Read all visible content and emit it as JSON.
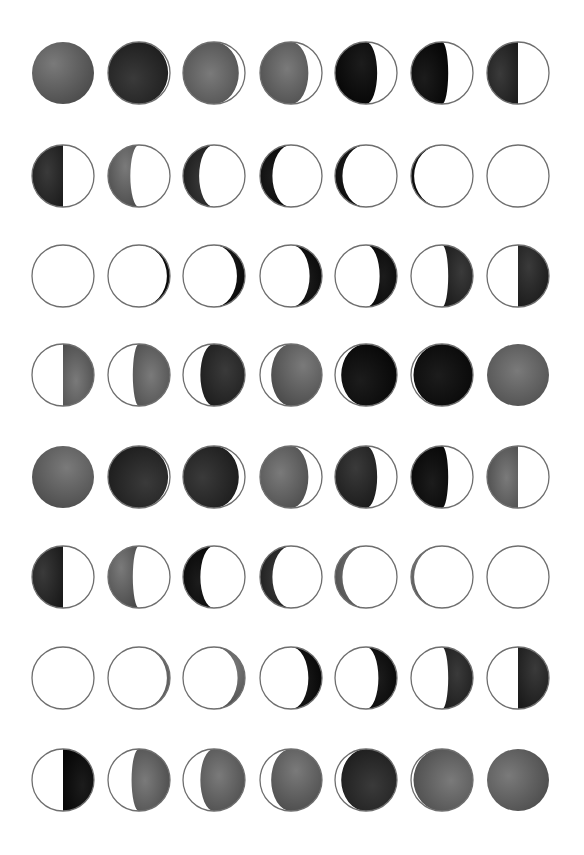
{
  "sheet": {
    "background": "#ffffff",
    "outline_color": "#6e6e6e",
    "lit_color": "#ffffff",
    "columns": 7,
    "rows": 8,
    "col_centers": [
      63,
      139,
      214,
      291,
      366,
      442,
      518
    ],
    "row_centers": [
      73,
      176,
      276,
      375,
      477,
      577,
      678,
      780
    ],
    "radius": 31
  },
  "palette": {
    "gray": [
      "#7a7a7a",
      "#4a4a4a"
    ],
    "dark": [
      "#3a3a3a",
      "#1a1a1a"
    ],
    "black": [
      "#1c1c1c",
      "#050505"
    ]
  },
  "rows": [
    {
      "label": "waning-1",
      "moons": [
        {
          "side": "full",
          "dark": 1.0,
          "tone": "gray"
        },
        {
          "side": "left",
          "dark": 0.97,
          "tone": "dark"
        },
        {
          "side": "left",
          "dark": 0.9,
          "tone": "gray"
        },
        {
          "side": "left",
          "dark": 0.78,
          "tone": "gray"
        },
        {
          "side": "left",
          "dark": 0.68,
          "tone": "black"
        },
        {
          "side": "left",
          "dark": 0.6,
          "tone": "black"
        },
        {
          "side": "left",
          "dark": 0.5,
          "tone": "dark"
        }
      ]
    },
    {
      "label": "waning-2",
      "moons": [
        {
          "side": "left",
          "dark": 0.5,
          "tone": "dark"
        },
        {
          "side": "left",
          "dark": 0.36,
          "tone": "gray"
        },
        {
          "side": "left",
          "dark": 0.26,
          "tone": "dark"
        },
        {
          "side": "left",
          "dark": 0.2,
          "tone": "black"
        },
        {
          "side": "left",
          "dark": 0.12,
          "tone": "black"
        },
        {
          "side": "left",
          "dark": 0.05,
          "tone": "black"
        },
        {
          "side": "none",
          "dark": 0.0,
          "tone": "black"
        }
      ]
    },
    {
      "label": "waxing-1",
      "moons": [
        {
          "side": "none",
          "dark": 0.0,
          "tone": "black"
        },
        {
          "side": "right",
          "dark": 0.05,
          "tone": "black"
        },
        {
          "side": "right",
          "dark": 0.13,
          "tone": "black"
        },
        {
          "side": "right",
          "dark": 0.2,
          "tone": "black"
        },
        {
          "side": "right",
          "dark": 0.28,
          "tone": "black"
        },
        {
          "side": "right",
          "dark": 0.4,
          "tone": "dark"
        },
        {
          "side": "right",
          "dark": 0.5,
          "tone": "dark"
        }
      ]
    },
    {
      "label": "waxing-2",
      "moons": [
        {
          "side": "right",
          "dark": 0.5,
          "tone": "gray"
        },
        {
          "side": "right",
          "dark": 0.6,
          "tone": "gray"
        },
        {
          "side": "right",
          "dark": 0.72,
          "tone": "dark"
        },
        {
          "side": "right",
          "dark": 0.82,
          "tone": "gray"
        },
        {
          "side": "right",
          "dark": 0.9,
          "tone": "black"
        },
        {
          "side": "right",
          "dark": 0.96,
          "tone": "black"
        },
        {
          "side": "full",
          "dark": 1.0,
          "tone": "gray"
        }
      ]
    },
    {
      "label": "waning-3",
      "moons": [
        {
          "side": "full",
          "dark": 1.0,
          "tone": "gray"
        },
        {
          "side": "left",
          "dark": 0.97,
          "tone": "dark"
        },
        {
          "side": "left",
          "dark": 0.9,
          "tone": "dark"
        },
        {
          "side": "left",
          "dark": 0.78,
          "tone": "gray"
        },
        {
          "side": "left",
          "dark": 0.68,
          "tone": "dark"
        },
        {
          "side": "left",
          "dark": 0.6,
          "tone": "black"
        },
        {
          "side": "left",
          "dark": 0.5,
          "tone": "gray"
        }
      ]
    },
    {
      "label": "waning-4",
      "moons": [
        {
          "side": "left",
          "dark": 0.5,
          "tone": "dark"
        },
        {
          "side": "left",
          "dark": 0.4,
          "tone": "gray"
        },
        {
          "side": "left",
          "dark": 0.28,
          "tone": "black"
        },
        {
          "side": "left",
          "dark": 0.2,
          "tone": "dark"
        },
        {
          "side": "left",
          "dark": 0.12,
          "tone": "gray"
        },
        {
          "side": "left",
          "dark": 0.05,
          "tone": "gray"
        },
        {
          "side": "none",
          "dark": 0.0,
          "tone": "gray"
        }
      ]
    },
    {
      "label": "waxing-3",
      "moons": [
        {
          "side": "none",
          "dark": 0.0,
          "tone": "gray"
        },
        {
          "side": "right",
          "dark": 0.05,
          "tone": "gray"
        },
        {
          "side": "right",
          "dark": 0.12,
          "tone": "gray"
        },
        {
          "side": "right",
          "dark": 0.22,
          "tone": "black"
        },
        {
          "side": "right",
          "dark": 0.3,
          "tone": "black"
        },
        {
          "side": "right",
          "dark": 0.4,
          "tone": "dark"
        },
        {
          "side": "right",
          "dark": 0.5,
          "tone": "dark"
        }
      ]
    },
    {
      "label": "waxing-4",
      "moons": [
        {
          "side": "right",
          "dark": 0.5,
          "tone": "black"
        },
        {
          "side": "right",
          "dark": 0.62,
          "tone": "gray"
        },
        {
          "side": "right",
          "dark": 0.72,
          "tone": "gray"
        },
        {
          "side": "right",
          "dark": 0.82,
          "tone": "gray"
        },
        {
          "side": "right",
          "dark": 0.9,
          "tone": "dark"
        },
        {
          "side": "right",
          "dark": 0.96,
          "tone": "gray"
        },
        {
          "side": "full",
          "dark": 1.0,
          "tone": "gray"
        }
      ]
    }
  ]
}
